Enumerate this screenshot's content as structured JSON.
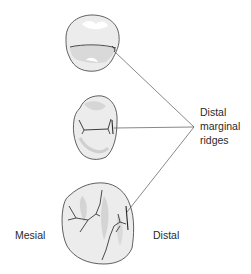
{
  "figure": {
    "labels": {
      "distal_marginal_ridges": [
        "Distal",
        "marginal",
        "ridges"
      ],
      "mesial": "Mesial",
      "distal": "Distal"
    },
    "teeth": [
      {
        "name": "top-tooth",
        "view": "occlusal"
      },
      {
        "name": "middle-tooth",
        "view": "occlusal"
      },
      {
        "name": "bottom-tooth",
        "view": "occlusal"
      }
    ],
    "colors": {
      "tooth_fill": "#ececec",
      "tooth_shade": "#d6d6d6",
      "outline": "#3a3a3a",
      "leader_line": "#555555",
      "text": "#2a2a2a"
    }
  }
}
